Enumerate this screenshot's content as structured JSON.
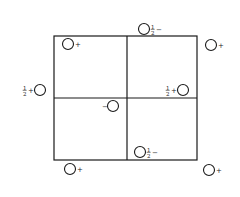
{
  "diagram": {
    "type": "charge-lattice",
    "box": {
      "x1": 54,
      "y1": 36,
      "x2": 197,
      "y2": 160
    },
    "dividers": {
      "vertical_x": 127,
      "horizontal_y": 98
    },
    "stroke_color": "#1a1a1a",
    "sites": [
      {
        "id": "top-left-inner",
        "cx": 68,
        "cy": 44,
        "r": 5.5,
        "label": "+",
        "fraction": "",
        "side": "right"
      },
      {
        "id": "top-edge",
        "cx": 144,
        "cy": 29,
        "r": 5.5,
        "label": "−",
        "fraction": "1/2",
        "side": "right"
      },
      {
        "id": "top-right-outer",
        "cx": 211,
        "cy": 45,
        "r": 5.5,
        "label": "+",
        "fraction": "",
        "side": "right"
      },
      {
        "id": "left-edge",
        "cx": 40,
        "cy": 90,
        "r": 5.5,
        "label": "+",
        "fraction": "1/2",
        "side": "left"
      },
      {
        "id": "center",
        "cx": 113,
        "cy": 106,
        "r": 5.5,
        "label": "−",
        "fraction": "",
        "side": "left"
      },
      {
        "id": "right-inner",
        "cx": 183,
        "cy": 90,
        "r": 5.5,
        "label": "+",
        "fraction": "1/2",
        "side": "left"
      },
      {
        "id": "bottom-inner",
        "cx": 140,
        "cy": 152,
        "r": 5.5,
        "label": "−",
        "fraction": "1/2",
        "side": "right"
      },
      {
        "id": "bottom-left-outer",
        "cx": 70,
        "cy": 169,
        "r": 5.5,
        "label": "+",
        "fraction": "",
        "side": "right"
      },
      {
        "id": "bottom-right-outer",
        "cx": 209,
        "cy": 170,
        "r": 5.5,
        "label": "+",
        "fraction": "",
        "side": "right"
      }
    ]
  }
}
